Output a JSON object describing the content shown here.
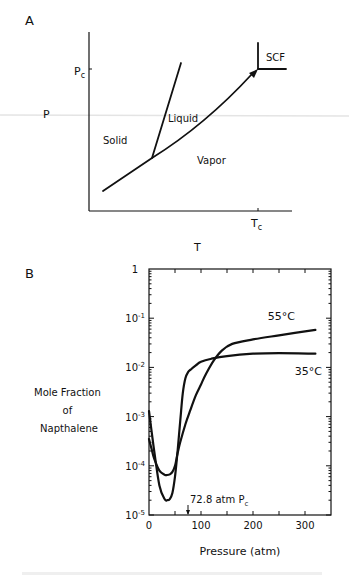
{
  "panel_a": {
    "panel_label": "A",
    "y_label": "P",
    "x_label": "T",
    "pc_label_main": "P",
    "pc_label_sub": "c",
    "tc_label_main": "T",
    "tc_label_sub": "c",
    "regions": {
      "solid": "Solid",
      "liquid": "Liquid",
      "vapor": "Vapor",
      "scf": "SCF"
    }
  },
  "panel_b": {
    "panel_label": "B",
    "y_label_lines": [
      "Mole Fraction",
      "of",
      "Napthalene"
    ],
    "annotation_main": "72.8 atm P",
    "annotation_sub": "c"
  },
  "chart_data": [
    {
      "type": "line",
      "title": "A",
      "description": "Schematic pressure-temperature phase diagram",
      "xlabel": "T",
      "ylabel": "P",
      "x_ticks": [
        "Tc"
      ],
      "y_ticks": [
        "Pc"
      ],
      "regions": [
        "Solid",
        "Liquid",
        "Vapor",
        "SCF"
      ],
      "series": [
        {
          "name": "sublimation-vaporization curve",
          "points": "triple point to critical point (arrowed)"
        },
        {
          "name": "melting curve",
          "points": "from triple point upward"
        }
      ]
    },
    {
      "type": "line",
      "title": "B",
      "xlabel": "Pressure (atm)",
      "ylabel": "Mole Fraction of Napthalene",
      "xlim": [
        0,
        350
      ],
      "ylim": [
        1e-05,
        1
      ],
      "yscale": "log",
      "x_ticks": [
        0,
        100,
        200,
        300
      ],
      "y_tick_labels": [
        "1",
        "10^-1",
        "10^-2",
        "10^-3",
        "10^-4",
        "10^-5"
      ],
      "y_tick_values": [
        1,
        0.1,
        0.01,
        0.001,
        0.0001,
        1e-05
      ],
      "annotations": [
        {
          "text": "72.8 atm Pc",
          "x": 72.8
        }
      ],
      "series": [
        {
          "name": "35°C",
          "x": [
            0,
            5,
            10,
            20,
            30,
            35,
            40,
            45,
            50,
            55,
            60,
            65,
            70,
            75,
            80,
            90,
            100,
            120,
            150,
            200,
            250,
            320
          ],
          "y": [
            0.0013,
            0.0005,
            0.0002,
            4e-05,
            2.1e-05,
            2e-05,
            2.1e-05,
            2.8e-05,
            6e-05,
            0.0002,
            0.0008,
            0.003,
            0.006,
            0.008,
            0.009,
            0.011,
            0.013,
            0.015,
            0.017,
            0.019,
            0.0195,
            0.019
          ]
        },
        {
          "name": "55°C",
          "x": [
            0,
            5,
            10,
            20,
            30,
            35,
            40,
            45,
            50,
            55,
            60,
            70,
            80,
            90,
            100,
            110,
            125,
            140,
            160,
            200,
            250,
            320
          ],
          "y": [
            0.00035,
            0.00022,
            0.00014,
            8e-05,
            6.6e-05,
            6.5e-05,
            6.7e-05,
            7.5e-05,
            0.0001,
            0.00018,
            0.0003,
            0.0007,
            0.0014,
            0.0027,
            0.0045,
            0.0075,
            0.014,
            0.022,
            0.03,
            0.037,
            0.045,
            0.058
          ]
        }
      ]
    }
  ]
}
